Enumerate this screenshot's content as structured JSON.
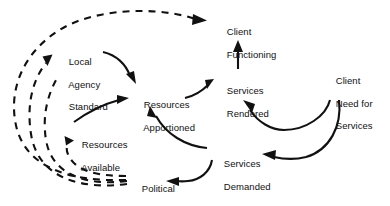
{
  "diagram": {
    "type": "causal-loop-diagram",
    "title": "",
    "background_color": "#ffffff",
    "line_color": "#111111",
    "nodes": [
      {
        "id": "client_functioning",
        "label": "Client\nFunctioning",
        "line1": "Client",
        "line2": "Functioning",
        "line3": "",
        "x": 216,
        "y": 15
      },
      {
        "id": "local_agency",
        "label": "Local\nAgency\nStandard",
        "line1": "Local",
        "line2": "Agency",
        "line3": "Standard",
        "x": 58,
        "y": 45
      },
      {
        "id": "services_rendered",
        "label": "Services\nRendered",
        "line1": "Services",
        "line2": "Rendered",
        "line3": "",
        "x": 216,
        "y": 74
      },
      {
        "id": "client_need",
        "label": "Client\nNeed for\nServices",
        "line1": "Client",
        "line2": "Need for",
        "line3": "Services",
        "x": 325,
        "y": 64
      },
      {
        "id": "resources_apportioned",
        "label": "Resources\nApportioned",
        "line1": "Resources",
        "line2": "Apportioned",
        "line3": "",
        "x": 133,
        "y": 88
      },
      {
        "id": "resources_available",
        "label": "Resources\nAvailable",
        "line1": "Resources",
        "line2": "Available",
        "line3": "",
        "x": 71,
        "y": 128
      },
      {
        "id": "services_demanded",
        "label": "Services\nDemanded",
        "line1": "Services",
        "line2": "Demanded",
        "line3": "",
        "x": 213,
        "y": 147
      },
      {
        "id": "political_pressure",
        "label": "Political\nPressure",
        "line1": "Political",
        "line2": "Pressure",
        "line3": "",
        "x": 131,
        "y": 172
      }
    ],
    "edges": [
      {
        "id": "e1",
        "from": "local_agency",
        "to": "resources_apportioned",
        "style": "solid",
        "label": ""
      },
      {
        "id": "e2",
        "from": "resources_available",
        "to": "resources_apportioned",
        "style": "solid",
        "label": ""
      },
      {
        "id": "e3",
        "from": "services_demanded",
        "to": "resources_apportioned",
        "style": "solid",
        "label": ""
      },
      {
        "id": "e4",
        "from": "resources_apportioned",
        "to": "services_rendered",
        "style": "solid",
        "label": ""
      },
      {
        "id": "e5",
        "from": "services_rendered",
        "to": "client_functioning",
        "style": "solid",
        "label": ""
      },
      {
        "id": "e6",
        "from": "client_need",
        "to": "services_rendered",
        "style": "solid",
        "label": ""
      },
      {
        "id": "e7",
        "from": "client_need",
        "to": "services_demanded",
        "style": "solid",
        "label": ""
      },
      {
        "id": "e8",
        "from": "services_demanded",
        "to": "political_pressure",
        "style": "solid",
        "label": ""
      },
      {
        "id": "e9",
        "from": "political_pressure",
        "to": "resources_available",
        "style": "dashed",
        "label": ""
      },
      {
        "id": "e10",
        "from": "political_pressure",
        "to": "local_agency",
        "style": "dashed",
        "label": ""
      },
      {
        "id": "e11",
        "from": "political_pressure",
        "to": "client_functioning",
        "style": "dashed",
        "label": ""
      }
    ]
  }
}
